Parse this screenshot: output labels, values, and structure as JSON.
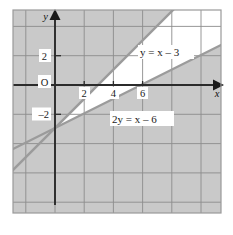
{
  "figure": {
    "axes": {
      "x_axis_name": "x",
      "y_axis_name": "y",
      "origin_label": "O",
      "x_ticks": [
        {
          "value": 2,
          "label": "2"
        },
        {
          "value": 4,
          "label": "4"
        },
        {
          "value": 6,
          "label": "6"
        }
      ],
      "y_ticks": [
        {
          "value": 2,
          "label": "2"
        },
        {
          "value": -2,
          "label": "–2"
        }
      ],
      "xlim": [
        -3,
        8.4
      ],
      "ylim": [
        -8.8,
        5.2
      ],
      "grid": true,
      "x_arrow": true,
      "y_arrow": true
    },
    "lines": [
      {
        "id": "line-y-eq-x-minus-3",
        "label": "y = x – 3",
        "label_parts": {
          "lhs": "y",
          "eq": " = ",
          "rhs_var": "x",
          "op": " – ",
          "rhs_const": "3"
        },
        "slope": 1,
        "intercept": -3,
        "x_intercept": 3,
        "y_intercept": -3
      },
      {
        "id": "line-2y-eq-x-minus-6",
        "label": "2y = x – 6",
        "label_parts": {
          "coef": "2",
          "lhs": "y",
          "eq": " = ",
          "rhs_var": "x",
          "op": " – ",
          "rhs_const": "6"
        },
        "slope": 0.5,
        "intercept": -3,
        "x_intercept": 6,
        "y_intercept": -3
      }
    ],
    "intersection_point": {
      "x": 0,
      "y": -3
    },
    "unshaded_region": "between the two lines, below y = x – 3 and above 2y = x – 6",
    "colors": {
      "shaded_fill": "#c9c9c9",
      "unshaded_fill": "#ffffff",
      "gridline": "#8c8c8c",
      "axis": "#2b2b2b",
      "line_stroke": "#9b9b9b",
      "plot_border": "#9a9a9a",
      "page_background": "#ffffff"
    }
  }
}
